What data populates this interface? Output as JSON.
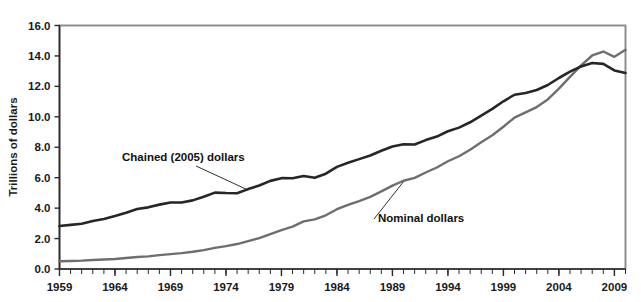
{
  "chart_data": {
    "type": "line",
    "title": "",
    "xlabel": "",
    "ylabel": "Trillions of dollars",
    "xlim": [
      1959,
      2010
    ],
    "ylim": [
      0.0,
      16.0
    ],
    "grid": false,
    "legend_position": "inline-annotations",
    "y_ticks": [
      "0.0",
      "2.0",
      "4.0",
      "6.0",
      "8.0",
      "10.0",
      "12.0",
      "14.0",
      "16.0"
    ],
    "y_tick_values": [
      0.0,
      2.0,
      4.0,
      6.0,
      8.0,
      10.0,
      12.0,
      14.0,
      16.0
    ],
    "x_ticks": [
      "1959",
      "1964",
      "1969",
      "1974",
      "1979",
      "1984",
      "1989",
      "1994",
      "1999",
      "2004",
      "2009"
    ],
    "x_tick_values": [
      1959,
      1964,
      1969,
      1974,
      1979,
      1984,
      1989,
      1994,
      1999,
      2004,
      2009
    ],
    "x_minor_tick_interval": 1,
    "x": [
      1959,
      1960,
      1961,
      1962,
      1963,
      1964,
      1965,
      1966,
      1967,
      1968,
      1969,
      1970,
      1971,
      1972,
      1973,
      1974,
      1975,
      1976,
      1977,
      1978,
      1979,
      1980,
      1981,
      1982,
      1983,
      1984,
      1985,
      1986,
      1987,
      1988,
      1989,
      1990,
      1991,
      1992,
      1993,
      1994,
      1995,
      1996,
      1997,
      1998,
      1999,
      2000,
      2001,
      2002,
      2003,
      2004,
      2005,
      2006,
      2007,
      2008,
      2009,
      2010
    ],
    "series": [
      {
        "name": "Chained (2005) dollars",
        "color": "#262626",
        "width": 2.6,
        "values": [
          2.83,
          2.9,
          2.97,
          3.15,
          3.29,
          3.48,
          3.7,
          3.94,
          4.05,
          4.23,
          4.37,
          4.37,
          4.51,
          4.75,
          5.02,
          4.99,
          4.98,
          5.25,
          5.49,
          5.79,
          5.97,
          5.96,
          6.11,
          5.99,
          6.26,
          6.71,
          6.98,
          7.22,
          7.46,
          7.77,
          8.05,
          8.2,
          8.18,
          8.47,
          8.7,
          9.05,
          9.29,
          9.64,
          10.08,
          10.52,
          11.02,
          11.45,
          11.56,
          11.76,
          12.09,
          12.55,
          12.97,
          13.31,
          13.54,
          13.48,
          13.05,
          12.88
        ]
      },
      {
        "name": "Nominal dollars",
        "color": "#6e6e6e",
        "width": 2.4,
        "values": [
          0.51,
          0.53,
          0.55,
          0.59,
          0.62,
          0.66,
          0.72,
          0.79,
          0.83,
          0.91,
          0.98,
          1.04,
          1.13,
          1.24,
          1.39,
          1.5,
          1.64,
          1.83,
          2.03,
          2.29,
          2.56,
          2.79,
          3.13,
          3.26,
          3.53,
          3.93,
          4.22,
          4.46,
          4.74,
          5.1,
          5.48,
          5.8,
          5.99,
          6.34,
          6.67,
          7.08,
          7.41,
          7.84,
          8.33,
          8.79,
          9.35,
          9.95,
          10.29,
          10.64,
          11.14,
          11.85,
          12.62,
          13.38,
          14.03,
          14.29,
          13.94,
          14.4
        ]
      }
    ],
    "annotations": [
      {
        "text": "Chained (2005) dollars",
        "series": "Chained (2005) dollars"
      },
      {
        "text": "Nominal dollars",
        "series": "Nominal dollars"
      }
    ]
  },
  "axes": {
    "y_title": "Trillions of dollars"
  },
  "colors": {
    "chained_line": "#262626",
    "nominal_line": "#6e6e6e",
    "frame": "#8d8d8d",
    "text": "#1a1a1a",
    "background": "#ffffff"
  }
}
